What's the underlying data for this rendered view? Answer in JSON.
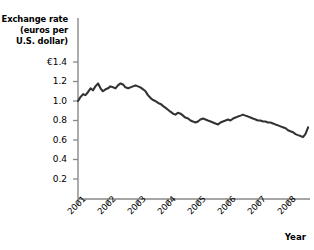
{
  "chart_data": {
    "type": "line",
    "title": "",
    "ylabel": "Exchange rate (euros per U.S. dollar)",
    "ylabel_lines": [
      "Exchange rate",
      "(euros per",
      "U.S. dollar)"
    ],
    "xlabel": "Year",
    "ylim": [
      0,
      1.4
    ],
    "xlim": [
      2001,
      2008.75
    ],
    "grid": false,
    "legend": null,
    "currency_symbol": "€",
    "ytick_labels": [
      "€1.4",
      "1.2",
      "1.0",
      "0.8",
      "0.6",
      "0.4",
      "0.2"
    ],
    "ytick_values": [
      1.4,
      1.2,
      1.0,
      0.8,
      0.6,
      0.4,
      0.2
    ],
    "xtick_labels": [
      "2001",
      "2002",
      "2003",
      "2004",
      "2005",
      "2006",
      "2007",
      "2008"
    ],
    "xtick_values": [
      2001,
      2002,
      2003,
      2004,
      2005,
      2006,
      2007,
      2008
    ],
    "series": [
      {
        "name": "Euros per U.S. dollar",
        "color": "#333333",
        "x": [
          2001.0,
          2001.08,
          2001.17,
          2001.25,
          2001.33,
          2001.42,
          2001.5,
          2001.58,
          2001.67,
          2001.75,
          2001.83,
          2001.92,
          2002.0,
          2002.08,
          2002.17,
          2002.25,
          2002.33,
          2002.42,
          2002.5,
          2002.58,
          2002.67,
          2002.75,
          2002.83,
          2002.92,
          2003.0,
          2003.08,
          2003.17,
          2003.25,
          2003.33,
          2003.42,
          2003.5,
          2003.58,
          2003.67,
          2003.75,
          2003.83,
          2003.92,
          2004.0,
          2004.08,
          2004.17,
          2004.25,
          2004.33,
          2004.42,
          2004.5,
          2004.58,
          2004.67,
          2004.75,
          2004.83,
          2004.92,
          2005.0,
          2005.08,
          2005.17,
          2005.25,
          2005.33,
          2005.42,
          2005.5,
          2005.58,
          2005.67,
          2005.75,
          2005.83,
          2005.92,
          2006.0,
          2006.08,
          2006.17,
          2006.25,
          2006.33,
          2006.42,
          2006.5,
          2006.58,
          2006.67,
          2006.75,
          2006.83,
          2006.92,
          2007.0,
          2007.08,
          2007.17,
          2007.25,
          2007.33,
          2007.42,
          2007.5,
          2007.58,
          2007.67,
          2007.75,
          2007.83,
          2007.92,
          2008.0,
          2008.08,
          2008.17,
          2008.25,
          2008.33,
          2008.42,
          2008.5,
          2008.58,
          2008.67
        ],
        "values": [
          1.0,
          1.04,
          1.07,
          1.06,
          1.09,
          1.13,
          1.11,
          1.15,
          1.18,
          1.13,
          1.1,
          1.12,
          1.13,
          1.15,
          1.14,
          1.13,
          1.16,
          1.18,
          1.17,
          1.14,
          1.13,
          1.14,
          1.15,
          1.16,
          1.15,
          1.14,
          1.12,
          1.1,
          1.06,
          1.03,
          1.01,
          1.0,
          0.98,
          0.97,
          0.95,
          0.93,
          0.91,
          0.89,
          0.87,
          0.86,
          0.88,
          0.87,
          0.85,
          0.83,
          0.82,
          0.8,
          0.79,
          0.78,
          0.79,
          0.81,
          0.82,
          0.81,
          0.8,
          0.79,
          0.78,
          0.77,
          0.76,
          0.78,
          0.79,
          0.8,
          0.81,
          0.8,
          0.82,
          0.83,
          0.84,
          0.85,
          0.86,
          0.85,
          0.84,
          0.83,
          0.82,
          0.81,
          0.8,
          0.8,
          0.79,
          0.79,
          0.78,
          0.78,
          0.77,
          0.76,
          0.75,
          0.74,
          0.73,
          0.72,
          0.7,
          0.69,
          0.68,
          0.66,
          0.65,
          0.64,
          0.63,
          0.66,
          0.73
        ]
      }
    ]
  }
}
